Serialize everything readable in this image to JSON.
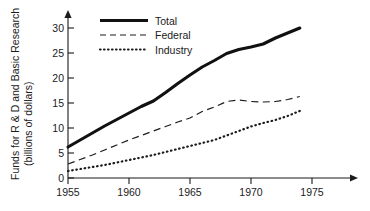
{
  "chart_data": {
    "type": "line",
    "title": "",
    "xlabel": "",
    "ylabel": "Funds for R & D and Basic Research (billions of dollars)",
    "ylabel_line1": "Funds for R & D and Basic Research",
    "ylabel_line2": "(billions of dollars)",
    "xlim": [
      1955,
      1976
    ],
    "ylim": [
      0,
      32
    ],
    "grid": false,
    "legend_position": "top-center",
    "x_ticks": [
      1955,
      1960,
      1965,
      1970,
      1975
    ],
    "x_tick_labels": [
      "1955",
      "1960",
      "1965",
      "1970",
      "1975"
    ],
    "y_ticks": [
      0,
      5,
      10,
      15,
      20,
      25,
      30
    ],
    "y_tick_labels": [
      "0",
      "5",
      "10",
      "15",
      "20",
      "25",
      "30"
    ],
    "x": [
      1955,
      1956,
      1957,
      1958,
      1959,
      1960,
      1961,
      1962,
      1963,
      1964,
      1965,
      1966,
      1967,
      1968,
      1969,
      1970,
      1971,
      1972,
      1973,
      1974
    ],
    "series": [
      {
        "name": "Total",
        "style": "solid-thick",
        "color": "#111111",
        "values": [
          6.2,
          7.6,
          9.0,
          10.4,
          11.7,
          13.0,
          14.3,
          15.4,
          17.1,
          18.9,
          20.6,
          22.2,
          23.5,
          24.9,
          25.7,
          26.2,
          26.8,
          28.0,
          29.0,
          30.0
        ]
      },
      {
        "name": "Federal",
        "style": "dashed",
        "color": "#1b1b1b",
        "values": [
          2.8,
          3.7,
          4.6,
          5.6,
          6.6,
          7.6,
          8.5,
          9.4,
          10.3,
          11.2,
          12.0,
          13.3,
          14.2,
          15.3,
          15.6,
          15.3,
          15.2,
          15.3,
          15.7,
          16.3
        ]
      },
      {
        "name": "Industry",
        "style": "dotted",
        "color": "#1b1b1b",
        "values": [
          1.4,
          1.8,
          2.2,
          2.6,
          3.1,
          3.6,
          4.1,
          4.6,
          5.2,
          5.8,
          6.4,
          7.0,
          7.6,
          8.5,
          9.4,
          10.3,
          11.0,
          11.6,
          12.4,
          13.4
        ]
      }
    ]
  },
  "legend": {
    "items": [
      {
        "label": "Total",
        "style": "solid-thick"
      },
      {
        "label": "Federal",
        "style": "dashed"
      },
      {
        "label": "Industry",
        "style": "dotted"
      }
    ]
  },
  "axes": {
    "y_title_line1": "Funds for R & D and Basic Research",
    "y_title_line2": "(billions of dollars)"
  }
}
